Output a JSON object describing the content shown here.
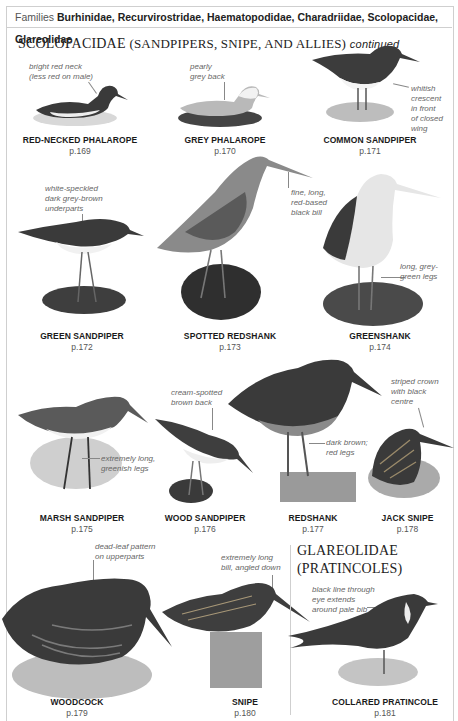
{
  "header": {
    "label": "Families",
    "families": "Burhinidae, Recurvirostridae, Haematopodidae, Charadriidae, Scolopacidae, Glareolidae"
  },
  "sections": [
    {
      "title": "SCOLOPACIDAE",
      "subtitle": "(SANDPIPERS, SNIPE, AND ALLIES)",
      "suffix": "continued"
    },
    {
      "title": "GLAREOLIDAE",
      "subtitle": "(PRATINCOLES)"
    }
  ],
  "birds": [
    {
      "name": "RED-NECKED PHALAROPE",
      "page": "p.169",
      "note": [
        "bright red neck",
        "(less red on male)"
      ]
    },
    {
      "name": "GREY PHALAROPE",
      "page": "p.170",
      "note": [
        "pearly",
        "grey back"
      ]
    },
    {
      "name": "COMMON SANDPIPER",
      "page": "p.171",
      "note": [
        "whitish",
        "crescent",
        "in front",
        "of closed",
        "wing"
      ]
    },
    {
      "name": "GREEN SANDPIPER",
      "page": "p.172",
      "note": [
        "white-speckled",
        "dark grey-brown",
        "underparts"
      ]
    },
    {
      "name": "SPOTTED REDSHANK",
      "page": "p.173",
      "note": [
        "fine, long,",
        "red-based",
        "black bill"
      ]
    },
    {
      "name": "GREENSHANK",
      "page": "p.174",
      "note": [
        "long, grey-",
        "green legs"
      ]
    },
    {
      "name": "MARSH SANDPIPER",
      "page": "p.175",
      "note": [
        "extremely long,",
        "greenish legs"
      ]
    },
    {
      "name": "WOOD SANDPIPER",
      "page": "p.176",
      "note": [
        "cream-spotted",
        "brown back"
      ]
    },
    {
      "name": "REDSHANK",
      "page": "p.177",
      "note": [
        "dark brown;",
        "red legs"
      ]
    },
    {
      "name": "JACK SNIPE",
      "page": "p.178",
      "note": [
        "striped crown",
        "with black",
        "centre"
      ]
    },
    {
      "name": "WOODCOCK",
      "page": "p.179",
      "note": [
        "dead-leaf pattern",
        "on upperparts"
      ]
    },
    {
      "name": "SNIPE",
      "page": "p.180",
      "note": [
        "extremely long",
        "bill, angled down"
      ]
    },
    {
      "name": "COLLARED PRATINCOLE",
      "page": "p.181",
      "note": [
        "black line through",
        "eye extends",
        "around pale bib"
      ]
    }
  ]
}
